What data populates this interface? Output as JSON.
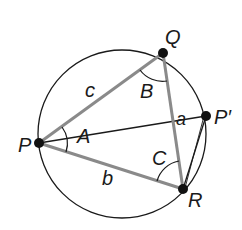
{
  "diagram": {
    "type": "inscribed-triangle",
    "circle": {
      "cx": 122,
      "cy": 134,
      "r": 84,
      "stroke": "#1a1a1a"
    },
    "points": {
      "P": {
        "x": 39,
        "y": 143,
        "label": "P"
      },
      "Q": {
        "x": 163,
        "y": 53,
        "label": "Q"
      },
      "R": {
        "x": 183,
        "y": 189,
        "label": "R"
      },
      "P_prime": {
        "x": 206,
        "y": 116,
        "label": "P′"
      }
    },
    "sides": {
      "a": {
        "label": "a",
        "from": "Q",
        "to": "R"
      },
      "b": {
        "label": "b",
        "from": "P",
        "to": "R"
      },
      "c": {
        "label": "c",
        "from": "P",
        "to": "Q"
      }
    },
    "angles": {
      "A": {
        "label": "A",
        "vertex": "P"
      },
      "B": {
        "label": "B",
        "vertex": "Q"
      },
      "C": {
        "label": "C",
        "vertex": "R"
      }
    },
    "colors": {
      "triangle": "#8a8a8a",
      "thin": "#1a1a1a",
      "dot": "#111111"
    }
  }
}
